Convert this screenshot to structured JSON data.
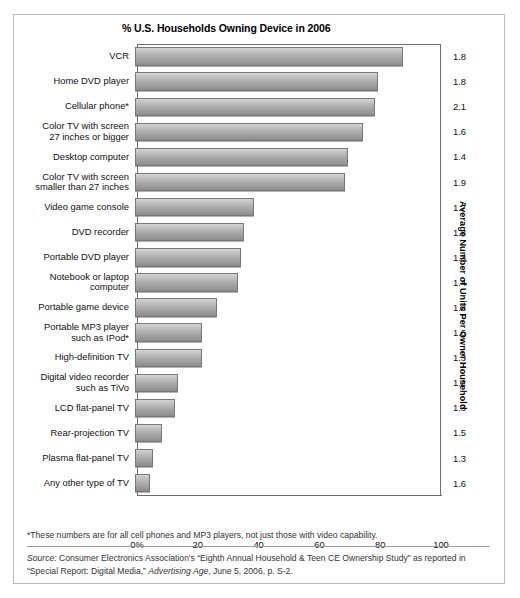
{
  "chart_data": {
    "type": "bar",
    "orientation": "horizontal",
    "title": "% U.S. Households Owning Device in 2006",
    "xlabel": "",
    "ylabel": "",
    "right_axis_title": "Average Number of Units Per Owner Household",
    "xlim": [
      0,
      100
    ],
    "xticks": [
      "0%",
      "20",
      "40",
      "60",
      "80",
      "100"
    ],
    "xtick_values": [
      0,
      20,
      40,
      60,
      80,
      100
    ],
    "grid": false,
    "legend": "none",
    "categories": [
      "VCR",
      "Home DVD player",
      "Cellular phone*",
      "Color TV with screen 27 inches or bigger",
      "Desktop computer",
      "Color TV with screen smaller than 27 inches",
      "Video game console",
      "DVD recorder",
      "Portable DVD player",
      "Notebook or laptop computer",
      "Portable game device",
      "Portable MP3 player such as IPod*",
      "High-definition TV",
      "Digital video recorder such as TiVo",
      "LCD flat-panel TV",
      "Rear-projection TV",
      "Plasma flat-panel TV",
      "Any other type of TV"
    ],
    "values": [
      88,
      80,
      79,
      75,
      70,
      69,
      39,
      36,
      35,
      34,
      27,
      22,
      22,
      14,
      13,
      9,
      6,
      5
    ],
    "series": [
      {
        "name": "% U.S. Households Owning Device in 2006",
        "values": [
          88,
          80,
          79,
          75,
          70,
          69,
          39,
          36,
          35,
          34,
          27,
          22,
          22,
          14,
          13,
          9,
          6,
          5
        ]
      },
      {
        "name": "Average Number of Units Per Owner Household",
        "values": [
          1.8,
          1.8,
          2.1,
          1.6,
          1.4,
          1.9,
          1.7,
          1.3,
          1.3,
          1.4,
          1.8,
          1.6,
          1.3,
          1.2,
          1.3,
          1.5,
          1.3,
          1.6
        ]
      }
    ]
  },
  "rows": [
    {
      "label_line1": "VCR",
      "label_line2": "",
      "value": 88,
      "units": "1.8"
    },
    {
      "label_line1": "Home DVD player",
      "label_line2": "",
      "value": 80,
      "units": "1.8"
    },
    {
      "label_line1": "Cellular phone*",
      "label_line2": "",
      "value": 79,
      "units": "2.1"
    },
    {
      "label_line1": "Color TV with screen",
      "label_line2": "27 inches or bigger",
      "value": 75,
      "units": "1.6"
    },
    {
      "label_line1": "Desktop computer",
      "label_line2": "",
      "value": 70,
      "units": "1.4"
    },
    {
      "label_line1": "Color TV with screen",
      "label_line2": "smaller than 27 inches",
      "value": 69,
      "units": "1.9"
    },
    {
      "label_line1": "Video game console",
      "label_line2": "",
      "value": 39,
      "units": "1.7"
    },
    {
      "label_line1": "DVD recorder",
      "label_line2": "",
      "value": 36,
      "units": "1.3"
    },
    {
      "label_line1": "Portable DVD player",
      "label_line2": "",
      "value": 35,
      "units": "1.3"
    },
    {
      "label_line1": "Notebook or laptop",
      "label_line2": "computer",
      "value": 34,
      "units": "1.4"
    },
    {
      "label_line1": "Portable game device",
      "label_line2": "",
      "value": 27,
      "units": "1.8"
    },
    {
      "label_line1": "Portable MP3 player",
      "label_line2": "such as IPod*",
      "value": 22,
      "units": "1.6"
    },
    {
      "label_line1": "High-definition TV",
      "label_line2": "",
      "value": 22,
      "units": "1.3"
    },
    {
      "label_line1": "Digital video recorder",
      "label_line2": "such as TiVo",
      "value": 14,
      "units": "1.2"
    },
    {
      "label_line1": "LCD flat-panel TV",
      "label_line2": "",
      "value": 13,
      "units": "1.3"
    },
    {
      "label_line1": "Rear-projection TV",
      "label_line2": "",
      "value": 9,
      "units": "1.5"
    },
    {
      "label_line1": "Plasma flat-panel TV",
      "label_line2": "",
      "value": 6,
      "units": "1.3"
    },
    {
      "label_line1": "Any other type of TV",
      "label_line2": "",
      "value": 5,
      "units": "1.6"
    }
  ],
  "notes": {
    "footnote": "*These numbers are for all cell phones and MP3 players, not just those with video capability.",
    "source_prefix": "Source:",
    "source_text_1": " Consumer Electronics Association's “Eighth Annual Household & Teen CE Ownership Study” as reported in “Special Report: Digital Media,” ",
    "source_italic": "Advertising Age",
    "source_text_2": ", June 5, 2006, p. S-2."
  },
  "colors": {
    "bar_top": "#d6d6d6",
    "bar_bottom": "#8c8c8c",
    "bar_border": "#787878",
    "axis": "#6d6d6d",
    "frame": "#b9b9b9",
    "text": "#111111"
  }
}
